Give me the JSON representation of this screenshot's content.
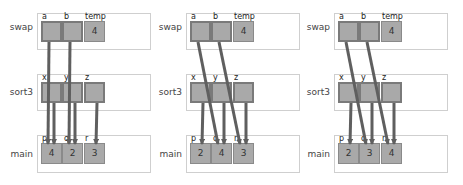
{
  "diagram": {
    "title": "",
    "colors": {
      "cell_fill": "#a9a9a9",
      "cell_border": "#8a8a8a",
      "arrow": "#5f5f5f",
      "frame_border": "#cfcfcf"
    },
    "panels": [
      {
        "frames": {
          "swap": {
            "label": "swap",
            "vars": [
              "a",
              "b",
              "temp"
            ],
            "values": [
              "",
              "",
              "4"
            ]
          },
          "sort3": {
            "label": "sort3",
            "vars": [
              "x",
              "y",
              "z"
            ],
            "values": [
              "",
              "",
              ""
            ]
          },
          "main": {
            "label": "main",
            "vars": [
              "p",
              "q",
              "r"
            ],
            "values": [
              "4",
              "2",
              "3"
            ]
          }
        },
        "arrows": [
          {
            "from": "swap.a",
            "to": "main.p"
          },
          {
            "from": "swap.b",
            "to": "main.q"
          },
          {
            "from": "sort3.x",
            "to": "main.p"
          },
          {
            "from": "sort3.y",
            "to": "main.q"
          },
          {
            "from": "sort3.z",
            "to": "main.r"
          }
        ]
      },
      {
        "frames": {
          "swap": {
            "label": "swap",
            "vars": [
              "a",
              "b",
              "temp"
            ],
            "values": [
              "",
              "",
              "4"
            ]
          },
          "sort3": {
            "label": "sort3",
            "vars": [
              "x",
              "y",
              "z"
            ],
            "values": [
              "",
              "",
              ""
            ]
          },
          "main": {
            "label": "main",
            "vars": [
              "p",
              "q",
              "r"
            ],
            "values": [
              "2",
              "4",
              "3"
            ]
          }
        },
        "arrows": [
          {
            "from": "swap.a",
            "to": "main.q"
          },
          {
            "from": "swap.b",
            "to": "main.r"
          },
          {
            "from": "sort3.x",
            "to": "main.p"
          },
          {
            "from": "sort3.y",
            "to": "main.q"
          },
          {
            "from": "sort3.z",
            "to": "main.r"
          }
        ]
      },
      {
        "frames": {
          "swap": {
            "label": "swap",
            "vars": [
              "a",
              "b",
              "temp"
            ],
            "values": [
              "",
              "",
              "4"
            ]
          },
          "sort3": {
            "label": "sort3",
            "vars": [
              "x",
              "y",
              "z"
            ],
            "values": [
              "",
              "",
              ""
            ]
          },
          "main": {
            "label": "main",
            "vars": [
              "p",
              "q",
              "r"
            ],
            "values": [
              "2",
              "3",
              "4"
            ]
          }
        },
        "arrows": [
          {
            "from": "swap.a",
            "to": "main.q"
          },
          {
            "from": "swap.b",
            "to": "main.r"
          },
          {
            "from": "sort3.x",
            "to": "main.p"
          },
          {
            "from": "sort3.y",
            "to": "main.q"
          },
          {
            "from": "sort3.z",
            "to": "main.r"
          }
        ]
      }
    ]
  }
}
